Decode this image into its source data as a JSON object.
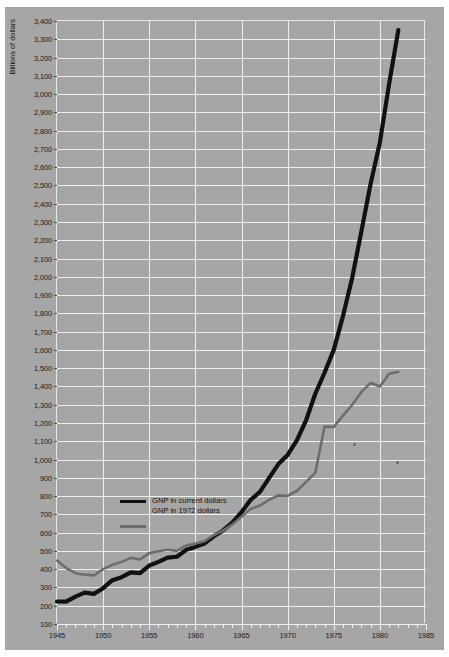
{
  "chart_data": {
    "type": "line",
    "title": "",
    "xlabel": "",
    "ylabel": "Billions of dollars",
    "xlim": [
      1945,
      1985
    ],
    "ylim": [
      100,
      3400
    ],
    "grid": true,
    "legend_position": "inside-left",
    "x_ticks": [
      1945,
      1950,
      1955,
      1960,
      1965,
      1970,
      1975,
      1980,
      1985
    ],
    "x_minor_step": 1,
    "y_ticks": [
      100,
      200,
      300,
      400,
      500,
      600,
      700,
      800,
      900,
      1000,
      1100,
      1200,
      1300,
      1400,
      1500,
      1600,
      1700,
      1800,
      1900,
      2000,
      2100,
      2200,
      2300,
      2400,
      2500,
      2600,
      2700,
      2800,
      2900,
      3000,
      3100,
      3200,
      3300,
      3400
    ],
    "y_tick_labels": [
      "100",
      "200",
      "300",
      "400",
      "500",
      "600",
      "700",
      "800",
      "900",
      "1,000",
      "1,100",
      "1,200",
      "1,300",
      "1,400",
      "1,500",
      "1,600",
      "1,700",
      "1,800",
      "1,900",
      "2,000",
      "2,100",
      "2,200",
      "2,300",
      "2,400",
      "2,500",
      "2,600",
      "2,700",
      "2,800",
      "2,900",
      "3,000",
      "3,100",
      "3,200",
      "3,300",
      "3,400"
    ],
    "x": [
      1945,
      1946,
      1947,
      1948,
      1949,
      1950,
      1951,
      1952,
      1953,
      1954,
      1955,
      1956,
      1957,
      1958,
      1959,
      1960,
      1961,
      1962,
      1963,
      1964,
      1965,
      1966,
      1967,
      1968,
      1969,
      1970,
      1971,
      1972,
      1973,
      1974,
      1975,
      1976,
      1977,
      1978,
      1979,
      1980,
      1981,
      1982
    ],
    "series": [
      {
        "name": "GNP in current dollars",
        "color": "#111111",
        "values": [
          223,
          222,
          244,
          270,
          267,
          294,
          339,
          358,
          380,
          381,
          415,
          438,
          461,
          468,
          504,
          521,
          540,
          578,
          611,
          654,
          710,
          779,
          822,
          898,
          974,
          1024,
          1103,
          1213,
          1359,
          1473,
          1598,
          1783,
          1991,
          2250,
          2508,
          2732,
          3053,
          3350
        ]
      },
      {
        "name": "GNP in 1972 dollars",
        "color": "#6d6d6d",
        "values": [
          447,
          407,
          379,
          369,
          365,
          398,
          423,
          440,
          461,
          453,
          487,
          497,
          505,
          499,
          529,
          540,
          552,
          586,
          610,
          644,
          686,
          729,
          748,
          780,
          803,
          801,
          827,
          877,
          926,
          910,
          898,
          948,
          992,
          1041,
          1072,
          1064,
          1088,
          1080
        ]
      }
    ],
    "series_polyline_points": {
      "GNP in current dollars": "1945,223 1946,222 1947,250 1948,272 1949,265 1950,296 1951,340 1952,356 1953,383 1954,378 1955,420 1956,440 1957,463 1958,468 1959,506 1960,522 1961,541 1962,580 1963,612 1964,655 1965,712 1966,780 1967,823 1968,900 1969,975 1970,1025 1971,1105 1972,1215 1973,1360 1974,1475 1975,1600 1976,1785 1977,1995 1978,2250 1979,2510 1980,2735 1981,3055 1982,3350",
      "GNP in 1972 dollars": "1945,447 1946,406 1947,378 1948,370 1949,366 1950,400 1951,424 1952,440 1953,462 1954,453 1955,488 1956,498 1957,506 1958,500 1959,530 1960,540 1961,553 1962,587 1963,611 1964,645 1965,687 1966,730 1967,748 1968,780 1969,804 1970,802 1971,828 1972,878 1973,928 1974,1180 1975,1178 1976,1240 1977,1300 1978,1370 1979,1420 1980,1400 1981,1470 1982,1480"
    }
  },
  "legend": {
    "entries": [
      {
        "label": "GNP in current dollars",
        "swatch": "black-line-swatch"
      },
      {
        "label": "GNP in 1972 dollars",
        "swatch": "gray-line-swatch"
      }
    ]
  },
  "axis": {
    "y_title": "Billions of dollars"
  }
}
